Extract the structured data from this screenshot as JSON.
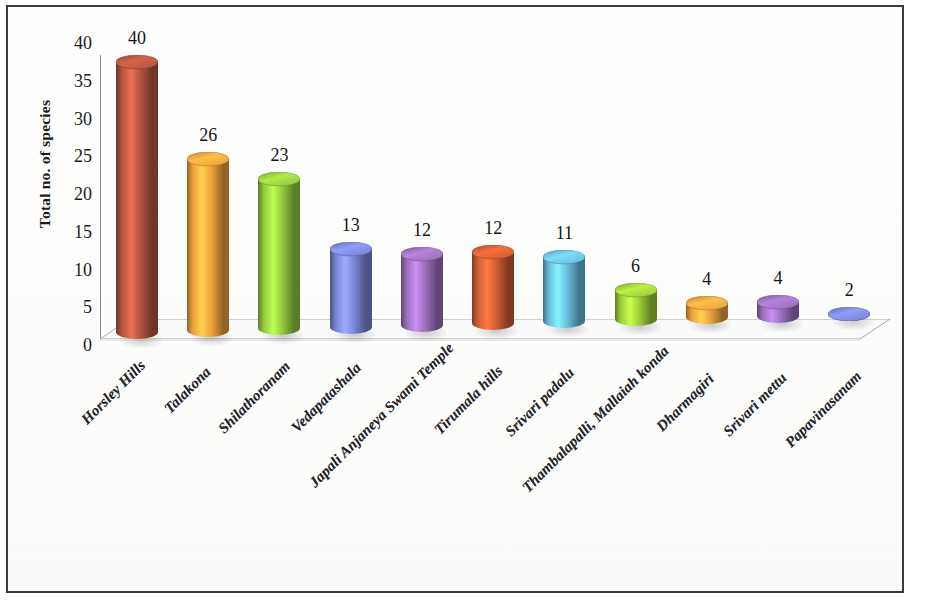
{
  "chart_data": {
    "type": "bar",
    "title": "",
    "subtitle": "",
    "xlabel": "",
    "ylabel": "Total no. of species",
    "ylim": [
      0,
      40
    ],
    "ytick_step": 5,
    "grid": false,
    "legend": "none",
    "style": "3d-cylinder",
    "categories": [
      "Horsley Hills",
      "Talakona",
      "Shilathoranam",
      "Vedapatashala",
      "Japali Anjaneya Swami Temple",
      "Tirumala hills",
      "Srivari padalu",
      "Thambalapalli, Mallaiah konda",
      "Dharmagiri",
      "Srivari mettu",
      "Papavinasanam"
    ],
    "values": [
      40,
      26,
      23,
      13,
      12,
      12,
      11,
      6,
      4,
      4,
      2
    ],
    "yticks": [
      "0",
      "5",
      "10",
      "15",
      "20",
      "25",
      "30",
      "35",
      "40"
    ],
    "bar_colors": [
      "#b4563f",
      "#efa13c",
      "#94c93f",
      "#7a85d4",
      "#9b6fbd",
      "#cf5d33",
      "#68bcdd",
      "#9ecd3a",
      "#eda23d",
      "#9a6fbe",
      "#7a85d4"
    ],
    "data_labels": [
      "40",
      "26",
      "23",
      "13",
      "12",
      "12",
      "11",
      "6",
      "4",
      "4",
      "2"
    ]
  },
  "figure": {
    "background_color": "#ffffff",
    "border_color": "#3a3a3a",
    "axis_color": "#8d8d8d",
    "text_color": "#1a1a1a"
  }
}
